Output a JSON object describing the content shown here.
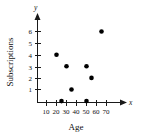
{
  "chart_data": {
    "type": "scatter",
    "title": "",
    "xlabel": "Age",
    "ylabel": "Subscriptions",
    "x_axis_variable": "x",
    "y_axis_variable": "y",
    "xlim": [
      0,
      78
    ],
    "ylim": [
      0,
      6.6
    ],
    "xticks": [
      10,
      20,
      30,
      40,
      50,
      60,
      70
    ],
    "xtick_labels": [
      "10",
      "20",
      "30",
      "40",
      "50",
      "60",
      "70"
    ],
    "yticks": [
      1,
      2,
      3,
      4,
      5,
      6
    ],
    "ytick_labels": [
      "1",
      "2",
      "3",
      "4",
      "5",
      "6"
    ],
    "grid": false,
    "legend": null,
    "point_color": "#000000",
    "axis_color": "#1a1a1a",
    "points": [
      {
        "x": 20,
        "y": 4
      },
      {
        "x": 25,
        "y": 0
      },
      {
        "x": 30,
        "y": 3
      },
      {
        "x": 35,
        "y": 1
      },
      {
        "x": 50,
        "y": 0
      },
      {
        "x": 50,
        "y": 3
      },
      {
        "x": 55,
        "y": 2
      },
      {
        "x": 65,
        "y": 6
      }
    ]
  }
}
